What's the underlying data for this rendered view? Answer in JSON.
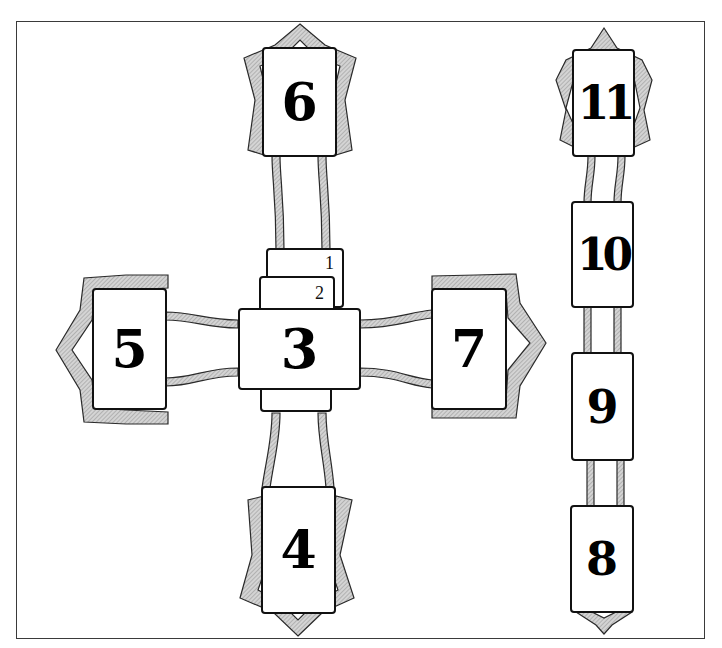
{
  "diagram": {
    "title": "",
    "type": "tarot-spread-layout",
    "colors": {
      "ornament_fill": "#bdbdbd",
      "ornament_stroke": "#2a2a2a",
      "card_border": "#111111",
      "background": "#ffffff"
    },
    "cross": {
      "center_cards": [
        {
          "position": "1",
          "label": "1"
        },
        {
          "position": "2",
          "label": "2"
        },
        {
          "position": "3",
          "label": "3"
        }
      ],
      "arms": [
        {
          "position": "4",
          "label": "4",
          "direction": "bottom"
        },
        {
          "position": "5",
          "label": "5",
          "direction": "left"
        },
        {
          "position": "6",
          "label": "6",
          "direction": "top"
        },
        {
          "position": "7",
          "label": "7",
          "direction": "right"
        }
      ]
    },
    "staff": [
      {
        "position": "8",
        "label": "8"
      },
      {
        "position": "9",
        "label": "9"
      },
      {
        "position": "10",
        "label": "10"
      },
      {
        "position": "11",
        "label": "11"
      }
    ]
  }
}
